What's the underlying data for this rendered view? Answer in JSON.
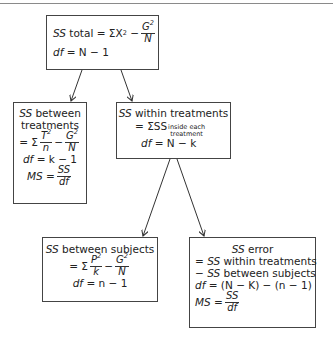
{
  "diagram": {
    "boxes": {
      "total": {
        "ss_label": "SS",
        "ss_name": "total",
        "formula_prefix": "= ΣX",
        "exp": "2",
        "minus": "−",
        "frac_num": "G",
        "frac_num_exp": "2",
        "frac_den": "N",
        "df_label": "df",
        "df_expr": "= N − 1"
      },
      "between_treatments": {
        "ss_label": "SS",
        "line1": "between",
        "line2": "treatments",
        "eq": "= Σ",
        "frac1_num": "T",
        "frac1_num_exp": "2",
        "frac1_den": "n",
        "minus": "−",
        "frac2_num": "G",
        "frac2_num_exp": "2",
        "frac2_den": "N",
        "df_label": "df",
        "df_expr": "= k − 1",
        "ms_label": "MS",
        "ms_eq": "=",
        "ms_num": "SS",
        "ms_den": "df"
      },
      "within_treatments": {
        "ss_label": "SS",
        "line1": "within treatments",
        "eq": "= ΣSS",
        "sub_line1": "inside each",
        "sub_line2": "treatment",
        "df_label": "df",
        "df_expr": "= N − k"
      },
      "between_subjects": {
        "ss_label": "SS",
        "line1": "between subjects",
        "eq": "= Σ",
        "frac1_num": "P",
        "frac1_num_exp": "2",
        "frac1_den": "k",
        "minus": "−",
        "frac2_num": "G",
        "frac2_num_exp": "2",
        "frac2_den": "N",
        "df_label": "df",
        "df_expr": "= n − 1"
      },
      "error": {
        "ss_label": "SS",
        "line1": "error",
        "line2_prefix": "=",
        "line2_ss": "SS",
        "line2_text": "within treatments",
        "line3_prefix": "−",
        "line3_ss": "SS",
        "line3_text": "between subjects",
        "df_label": "df",
        "df_expr": "= (N − K) − (n − 1)",
        "ms_label": "MS",
        "ms_eq": "=",
        "ms_num": "SS",
        "ms_den": "df"
      }
    },
    "edges": [
      {
        "from": "total",
        "to": "between_treatments"
      },
      {
        "from": "total",
        "to": "within_treatments"
      },
      {
        "from": "within_treatments",
        "to": "between_subjects"
      },
      {
        "from": "within_treatments",
        "to": "error"
      }
    ],
    "colors": {
      "border": "#444444",
      "arrow": "#333333",
      "top_rule": "#8a8a8a"
    }
  }
}
